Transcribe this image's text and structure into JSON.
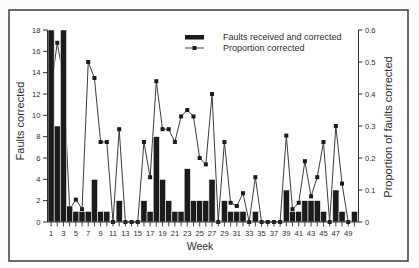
{
  "colors": {
    "background": "#ffffff",
    "frame": "#3a3a3a",
    "axis": "#2e2e2e",
    "bar_fill": "#1b1b1b",
    "bar_separator": "#f2f2f2",
    "line": "#3c3c3c",
    "marker": "#1b1b1b"
  },
  "chart_data": {
    "type": "bar+line",
    "title": "",
    "xlabel": "Week",
    "ylabel": "Faults corrected",
    "y2label": "Proportion of faults corrected",
    "ylim": [
      0,
      18
    ],
    "y2lim": [
      0,
      0.6
    ],
    "grid": false,
    "x": [
      1,
      2,
      3,
      4,
      5,
      6,
      7,
      8,
      9,
      10,
      11,
      12,
      13,
      14,
      15,
      16,
      17,
      18,
      19,
      20,
      21,
      22,
      23,
      24,
      25,
      26,
      27,
      28,
      29,
      30,
      31,
      32,
      33,
      34,
      35,
      36,
      37,
      38,
      39,
      40,
      41,
      42,
      43,
      44,
      45,
      46,
      47,
      48,
      49,
      50
    ],
    "x_tick_labels": [
      "1",
      "3",
      "5",
      "7",
      "9",
      "11",
      "13",
      "15",
      "17",
      "19",
      "21",
      "23",
      "25",
      "27",
      "29",
      "31",
      "33",
      "35",
      "37",
      "39",
      "41",
      "43",
      "45",
      "47",
      "49"
    ],
    "y_ticks": [
      "0",
      "2",
      "4",
      "6",
      "8",
      "10",
      "12",
      "14",
      "16",
      "18"
    ],
    "y2_ticks": [
      "0",
      "0.1",
      "0.2",
      "0.3",
      "0.4",
      "0.5",
      "0.6"
    ],
    "series": [
      {
        "name": "Faults received and corrected",
        "type": "bar",
        "axis": "left",
        "values": [
          18,
          9,
          18,
          1.5,
          1,
          1,
          1,
          4,
          1,
          1,
          0,
          2,
          0,
          0,
          0,
          2,
          1,
          8,
          4,
          2,
          1,
          1,
          5,
          2,
          2,
          2,
          4,
          0,
          2,
          1,
          1,
          1,
          0,
          1,
          0,
          0,
          0,
          0,
          3,
          1,
          1,
          2,
          2,
          2,
          1,
          0,
          3,
          1,
          0,
          1
        ]
      },
      {
        "name": "Proportion corrected",
        "type": "line",
        "axis": "right",
        "marker": "square",
        "values": [
          0.42,
          0.56,
          0.45,
          0.04,
          0.07,
          0.04,
          0.5,
          0.45,
          0.25,
          0.25,
          0,
          0.29,
          0,
          0,
          0,
          0.25,
          0.14,
          0.44,
          0.29,
          0.29,
          0.25,
          0.33,
          0.35,
          0.33,
          0.2,
          0.18,
          0.4,
          0,
          0.25,
          0.06,
          0.05,
          0.09,
          0,
          0.14,
          0,
          0,
          0,
          0,
          0.27,
          0.04,
          0.06,
          0.19,
          0.08,
          0.14,
          0.25,
          0,
          0.3,
          0.12,
          0,
          null
        ]
      }
    ],
    "legend": {
      "position": "top-center",
      "entries": [
        "Faults received and corrected",
        "Proportion corrected"
      ]
    }
  }
}
